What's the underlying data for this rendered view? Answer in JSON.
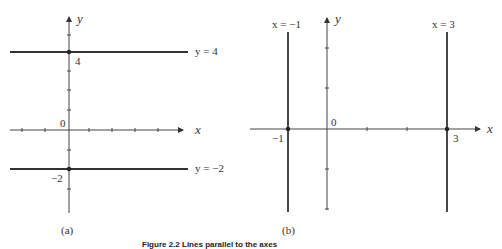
{
  "panel_a": {
    "label": "(a)",
    "x_axis_label": "x",
    "y_axis_label": "y",
    "origin_label": "0",
    "lines": [
      {
        "equation": "y = 4",
        "value_label": "4"
      },
      {
        "equation": "y = −2",
        "value_label": "−2"
      }
    ]
  },
  "panel_b": {
    "label": "(b)",
    "x_axis_label": "x",
    "y_axis_label": "y",
    "origin_label": "0",
    "lines": [
      {
        "equation": "x = −1",
        "value_label": "−1"
      },
      {
        "equation": "x = 3",
        "value_label": "3"
      }
    ]
  },
  "caption": "Figure 2.2 Lines parallel to the axes"
}
